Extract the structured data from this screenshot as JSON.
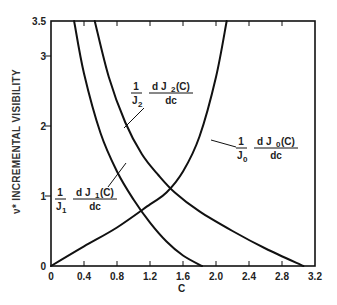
{
  "chart_data": {
    "type": "line",
    "title": "",
    "xlabel": "C",
    "ylabel": "ν* INCREMENTAL VISIBILITY",
    "xlim": [
      0,
      3.2
    ],
    "ylim": [
      0,
      3.5
    ],
    "x_ticks": [
      "0",
      "0.4",
      "0.8",
      "1.2",
      "1.6",
      "2.0",
      "2.4",
      "2.8",
      "3.2"
    ],
    "y_ticks": [
      "0",
      "1",
      "2",
      "3",
      "3.5"
    ],
    "grid": false,
    "legend": "none (curves labeled inline with leader lines)",
    "series": [
      {
        "name": "(1/J0) dJ0(C)/dc",
        "label_parts": {
          "num": "1",
          "den": "J",
          "sub": "0",
          "deriv_num": "d J",
          "deriv_sub": "0",
          "deriv_arg": "(C)",
          "deriv_den": "dc"
        },
        "x": [
          0.0,
          0.4,
          0.8,
          1.2,
          1.4,
          1.6,
          1.8,
          2.0,
          2.13
        ],
        "y": [
          0.0,
          0.28,
          0.55,
          0.88,
          1.05,
          1.35,
          1.85,
          2.7,
          3.5
        ]
      },
      {
        "name": "(1/J1) dJ1(C)/dc",
        "label_parts": {
          "num": "1",
          "den": "J",
          "sub": "1",
          "deriv_num": "d J",
          "deriv_sub": "1",
          "deriv_arg": "(C)",
          "deriv_den": "dc"
        },
        "x": [
          0.28,
          0.4,
          0.6,
          0.8,
          1.0,
          1.2,
          1.4,
          1.6,
          1.83
        ],
        "y": [
          3.5,
          2.75,
          1.9,
          1.35,
          0.95,
          0.62,
          0.35,
          0.15,
          0.0
        ]
      },
      {
        "name": "(1/J2) dJ2(C)/dc",
        "label_parts": {
          "num": "1",
          "den": "J",
          "sub": "2",
          "deriv_num": "d J",
          "deriv_sub": "2",
          "deriv_arg": "(C)",
          "deriv_den": "dc"
        },
        "x": [
          0.53,
          0.7,
          0.9,
          1.1,
          1.3,
          1.5,
          1.8,
          2.2,
          2.6,
          3.06
        ],
        "y": [
          3.5,
          2.7,
          2.05,
          1.6,
          1.3,
          1.05,
          0.78,
          0.5,
          0.25,
          0.0
        ]
      }
    ]
  },
  "labels": {
    "xlabel": "C",
    "ylabel": "ν* INCREMENTAL VISIBILITY"
  }
}
